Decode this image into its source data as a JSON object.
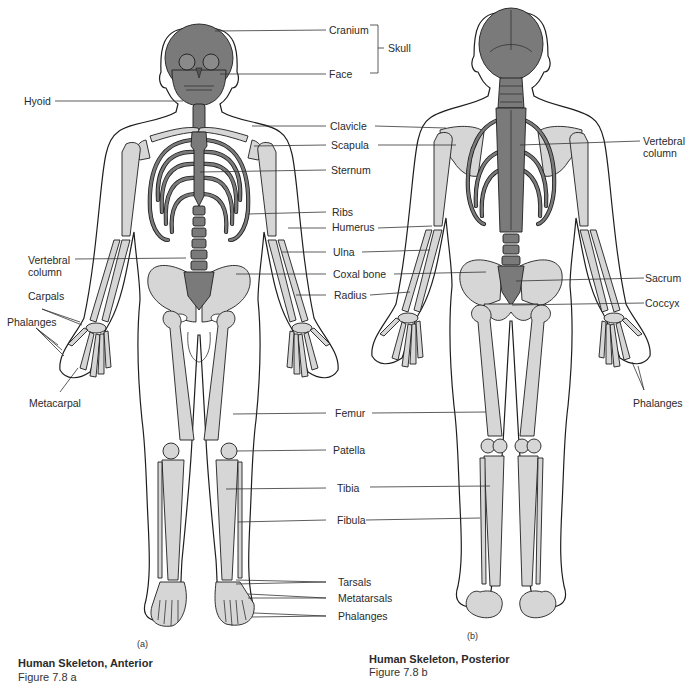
{
  "figure": {
    "type": "anatomical-diagram",
    "colors": {
      "dark_bone": "#7a7a7a",
      "light_bone": "#d6d6d6",
      "outline": "#1e1e1e",
      "background": "#ffffff",
      "leader_line": "#333333"
    }
  },
  "views": [
    {
      "id": "a",
      "sublabel": "(a)",
      "title": "Human Skeleton, Anterior",
      "figure_number": "Figure 7.8 a"
    },
    {
      "id": "b",
      "sublabel": "(b)",
      "title": "Human Skeleton, Posterior",
      "figure_number": "Figure 7.8 b"
    }
  ],
  "labels": {
    "cranium": "Cranium",
    "face": "Face",
    "skull": "Skull",
    "hyoid": "Hyoid",
    "clavicle": "Clavicle",
    "scapula": "Scapula",
    "sternum": "Sternum",
    "ribs": "Ribs",
    "humerus": "Humerus",
    "ulna": "Ulna",
    "coxal_bone": "Coxal bone",
    "radius": "Radius",
    "vertebral_column_left_1": "Vertebral",
    "vertebral_column_left_2": "column",
    "carpals": "Carpals",
    "phalanges_hand_left": "Phalanges",
    "metacarpal": "Metacarpal",
    "femur": "Femur",
    "patella": "Patella",
    "tibia": "Tibia",
    "fibula": "Fibula",
    "tarsals": "Tarsals",
    "metatarsals": "Metatarsals",
    "phalanges_foot": "Phalanges",
    "vertebral_column_right_1": "Vertebral",
    "vertebral_column_right_2": "column",
    "sacrum": "Sacrum",
    "coccyx": "Coccyx",
    "phalanges_hand_right": "Phalanges"
  }
}
